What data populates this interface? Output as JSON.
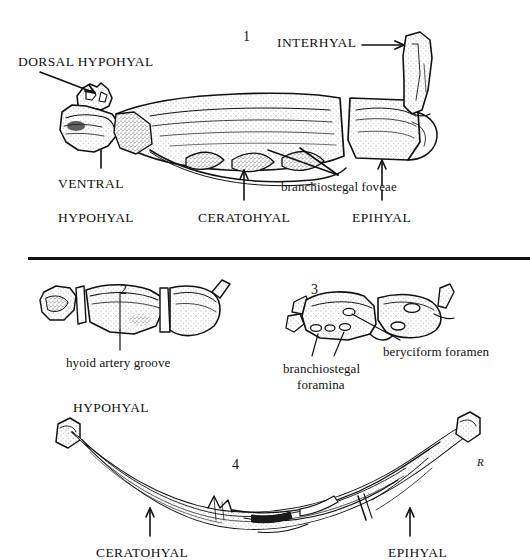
{
  "page": {
    "width": 530,
    "height": 560,
    "background": "#ffffff",
    "ink": "#111111"
  },
  "divider": {
    "name": "horizontal-rule",
    "x": 28,
    "y": 257,
    "width": 502,
    "height": 3,
    "color": "#111111"
  },
  "figures": [
    {
      "number": "1",
      "number_x": 243,
      "number_y": 30,
      "labels": [
        {
          "text": "DORSAL  HYPOHYAL",
          "style": "caps",
          "x": 18,
          "y": 55
        },
        {
          "text": "INTERHYAL",
          "style": "caps",
          "x": 277,
          "y": 36
        },
        {
          "text": "VENTRAL",
          "style": "caps",
          "x": 58,
          "y": 177
        },
        {
          "text": "HYPOHYAL",
          "style": "caps",
          "x": 58,
          "y": 211
        },
        {
          "text": "CERATOHYAL",
          "style": "caps",
          "x": 198,
          "y": 211
        },
        {
          "text": "branchiostegal foveae",
          "style": "lower",
          "x": 281,
          "y": 180
        },
        {
          "text": "EPIHYAL",
          "style": "caps",
          "x": 352,
          "y": 211
        }
      ]
    },
    {
      "number": "2",
      "number_x": 120,
      "number_y": 283,
      "labels": [
        {
          "text": "hyoid artery groove",
          "style": "lower",
          "x": 66,
          "y": 356
        }
      ]
    },
    {
      "number": "3",
      "number_x": 311,
      "number_y": 283,
      "labels": [
        {
          "text": "beryciform foramen",
          "style": "lower",
          "x": 383,
          "y": 345
        },
        {
          "text": "branchiostegal",
          "style": "lower",
          "x": 283,
          "y": 362
        },
        {
          "text": "foramina",
          "style": "lower",
          "x": 297,
          "y": 378
        }
      ]
    },
    {
      "number": "4",
      "number_x": 232,
      "number_y": 458,
      "labels": [
        {
          "text": "HYPOHYAL",
          "style": "caps",
          "x": 73,
          "y": 401
        },
        {
          "text": "CERATOHYAL",
          "style": "caps",
          "x": 96,
          "y": 546
        },
        {
          "text": "EPIHYAL",
          "style": "caps",
          "x": 388,
          "y": 546
        }
      ]
    }
  ],
  "signature": {
    "text": "R",
    "x": 479,
    "y": 463
  },
  "colors": {
    "ink": "#111111",
    "stipple": "#3a3a3a",
    "paper": "#ffffff"
  }
}
